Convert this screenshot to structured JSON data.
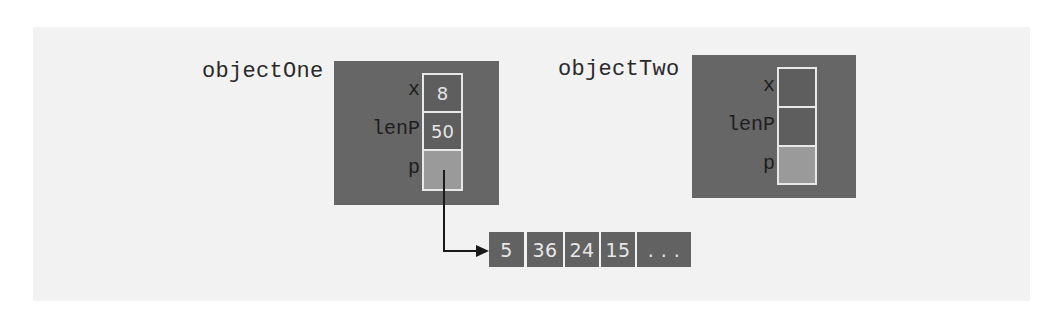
{
  "diagram": {
    "title": "",
    "colors": {
      "object_box": "#666666",
      "slot_border": "#e8e8e8",
      "pointer_slot": "#9a9a9a",
      "array_cell": "#626262",
      "text_dark": "#2a2a2a",
      "text_light": "#e6e6e6"
    },
    "objectOne": {
      "label": "objectOne",
      "fields": [
        {
          "name": "x",
          "value": "8"
        },
        {
          "name": "lenP",
          "value": "50"
        },
        {
          "name": "p",
          "value": ""
        }
      ]
    },
    "objectTwo": {
      "label": "objectTwo",
      "fields": [
        {
          "name": "x",
          "value": ""
        },
        {
          "name": "lenP",
          "value": ""
        },
        {
          "name": "p",
          "value": ""
        }
      ]
    },
    "array": {
      "cells": [
        "5",
        "36",
        "24",
        "15",
        ". . ."
      ]
    },
    "edges": [
      {
        "from": "objectOne.p",
        "to": "array[0]",
        "type": "pointer-arrow"
      }
    ]
  }
}
